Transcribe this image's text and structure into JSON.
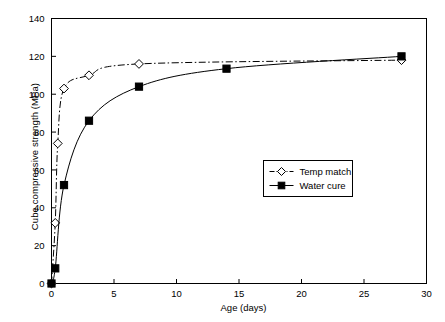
{
  "chart_data": {
    "type": "line",
    "title": "",
    "xlabel": "Age (days)",
    "ylabel": "Cube compressive strength (MPa)",
    "xlim": [
      0,
      30
    ],
    "ylim": [
      0,
      140
    ],
    "xticks": [
      0,
      5,
      10,
      15,
      20,
      25,
      30
    ],
    "xtick_labels": [
      "0",
      "5",
      "10",
      "15",
      "20",
      "25",
      "30"
    ],
    "yticks": [
      0,
      20,
      40,
      60,
      80,
      100,
      120,
      140
    ],
    "ytick_labels": [
      "0",
      "20",
      "40",
      "60",
      "80",
      "100",
      "120",
      "140"
    ],
    "grid": false,
    "legend_position": "center-right-lower",
    "series": [
      {
        "name": "Temp match",
        "marker": "open-diamond",
        "linestyle": "dash-dot",
        "color": "#000000",
        "x": [
          0,
          0.3,
          0.5,
          1,
          3,
          7,
          28
        ],
        "y": [
          0,
          32,
          74,
          103,
          110,
          116,
          118
        ]
      },
      {
        "name": "Water cure",
        "marker": "filled-square",
        "linestyle": "solid",
        "color": "#000000",
        "x": [
          0,
          0.3,
          1,
          3,
          7,
          14,
          28
        ],
        "y": [
          0,
          8,
          52,
          86,
          104,
          113.5,
          120
        ]
      }
    ]
  },
  "legend": {
    "entries": [
      {
        "label": "Temp match"
      },
      {
        "label": "Water cure"
      }
    ]
  },
  "axis": {
    "x_title": "Age (days)",
    "y_title": "Cube compressive strength (MPa)"
  },
  "colors": {
    "axis": "#000000",
    "series_temp_match": "#000000",
    "series_water_cure": "#000000",
    "background": "#ffffff"
  }
}
